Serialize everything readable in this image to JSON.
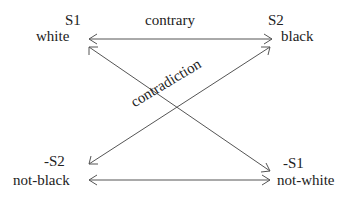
{
  "diagram": {
    "corners": {
      "top_left": {
        "symbol": "S1",
        "term": "white"
      },
      "top_right": {
        "symbol": "S2",
        "term": "black"
      },
      "bottom_left": {
        "symbol": "-S2",
        "term": "not-black"
      },
      "bottom_right": {
        "symbol": "-S1",
        "term": "not-white"
      }
    },
    "relations": {
      "top": "contrary",
      "diagonal": "contradiction"
    },
    "line_color": "#555555"
  }
}
